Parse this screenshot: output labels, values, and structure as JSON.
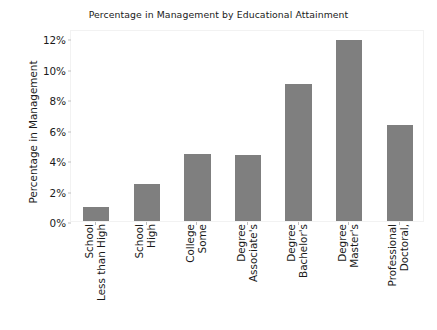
{
  "chart_data": {
    "type": "bar",
    "title": "Percentage in Management by Educational Attainment",
    "xlabel": "",
    "ylabel": "Percentage in Management",
    "categories": [
      "Less than High School",
      "High School",
      "Some College",
      "Associate's Degree",
      "Bachelor's Degree",
      "Master's Degree",
      "Doctoral, Professional"
    ],
    "values": [
      0.9,
      2.4,
      4.4,
      4.3,
      9.0,
      11.9,
      6.3
    ],
    "ylim": [
      0,
      12.6
    ],
    "yticks": [
      0,
      2,
      4,
      6,
      8,
      10,
      12
    ],
    "ytick_labels": [
      "0%",
      "2%",
      "4%",
      "6%",
      "8%",
      "10%",
      "12%"
    ],
    "grid": false,
    "legend": null,
    "bar_color": "#7f7f7f"
  }
}
